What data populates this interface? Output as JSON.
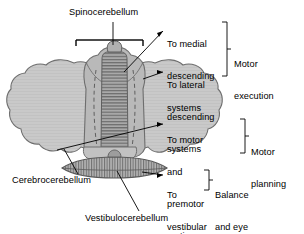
{
  "figure": {
    "type": "anatomical-diagram",
    "background_color": "#ffffff",
    "line_color": "#000000",
    "colors": {
      "hemisphere_fill": "#c9c9c9",
      "vermis_fill": "#a8a8a8",
      "outline": "#6e6e6e",
      "stripe": "#6b6b6b"
    }
  },
  "region_labels": [
    {
      "name": "spinocerebellum",
      "text": "Spinocerebellum"
    },
    {
      "name": "cerebrocerebellum",
      "text": "Cerebrocerebellum"
    },
    {
      "name": "vestibulocerebellum",
      "text": "Vestibulocerebellum"
    }
  ],
  "projections": [
    {
      "name": "medial-descending",
      "lines": [
        "To medial",
        "descending",
        "systems"
      ]
    },
    {
      "name": "lateral-descending",
      "lines": [
        "To lateral",
        "descending",
        "systems"
      ]
    },
    {
      "name": "motor-premotor-cortices",
      "lines": [
        "To motor",
        "and",
        "premotor",
        "cortices"
      ]
    },
    {
      "name": "vestibular-nuclei",
      "lines": [
        "To",
        "vestibular",
        "nuclei"
      ]
    }
  ],
  "functions": [
    {
      "name": "motor-execution",
      "lines": [
        "Motor",
        "execution"
      ]
    },
    {
      "name": "motor-planning",
      "lines": [
        "Motor",
        "planning"
      ]
    },
    {
      "name": "balance-eye-movements",
      "lines": [
        "Balance",
        "and eye",
        "movements"
      ]
    }
  ]
}
